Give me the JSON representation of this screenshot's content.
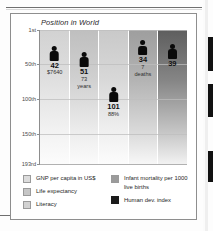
{
  "panel": {
    "title": "Position in World"
  },
  "axis": {
    "ticks": [
      {
        "label": "1st",
        "rank": 1
      },
      {
        "label": "50th",
        "rank": 50
      },
      {
        "label": "100th",
        "rank": 100
      },
      {
        "label": "150th",
        "rank": 150
      },
      {
        "label": "193rd",
        "rank": 193
      }
    ]
  },
  "legend": {
    "left": [
      {
        "label": "GNP per capita in US$",
        "color": "#dcdcdc"
      },
      {
        "label": "Life expectancy",
        "color": "#c6c6c6"
      },
      {
        "label": "Literacy",
        "color": "#d2d2d2"
      }
    ],
    "right": [
      {
        "label": "Infant mortality per 1000 live births",
        "color": "#9b9b9b"
      },
      {
        "label": "Human dev. index",
        "color": "#1b1b1b"
      }
    ]
  },
  "chart_data": {
    "type": "bar",
    "title": "Position in World",
    "xlabel": "",
    "ylabel": "Position in World",
    "ylim": [
      1,
      193
    ],
    "y_inverted": true,
    "grid": true,
    "ytick_labels": [
      "1st",
      "50th",
      "100th",
      "150th",
      "193rd"
    ],
    "ytick_values": [
      1,
      50,
      100,
      150,
      193
    ],
    "legend_position": "bottom",
    "categories": [
      "GNP per capita in US$",
      "Life expectancy",
      "Literacy",
      "Infant mortality per 1000 live births",
      "Human dev. index"
    ],
    "values": [
      42,
      51,
      101,
      34,
      39
    ],
    "points": [
      {
        "category": "GNP per capita in US$",
        "rank": 42,
        "rank_label": "42",
        "value_label": "$7640",
        "value_label2": "",
        "color": "#dcdcdc"
      },
      {
        "category": "Life expectancy",
        "rank": 51,
        "rank_label": "51",
        "value_label": "73",
        "value_label2": "years",
        "color": "#c6c6c6"
      },
      {
        "category": "Literacy",
        "rank": 101,
        "rank_label": "101",
        "value_label": "88%",
        "value_label2": "",
        "color": "#d2d2d2"
      },
      {
        "category": "Infant mortality per 1000 live births",
        "rank": 34,
        "rank_label": "34",
        "value_label": "7",
        "value_label2": "deaths",
        "color": "#9b9b9b"
      },
      {
        "category": "Human dev. index",
        "rank": 39,
        "rank_label": "39",
        "value_label": "",
        "value_label2": "",
        "color": "#1b1b1b"
      }
    ]
  }
}
